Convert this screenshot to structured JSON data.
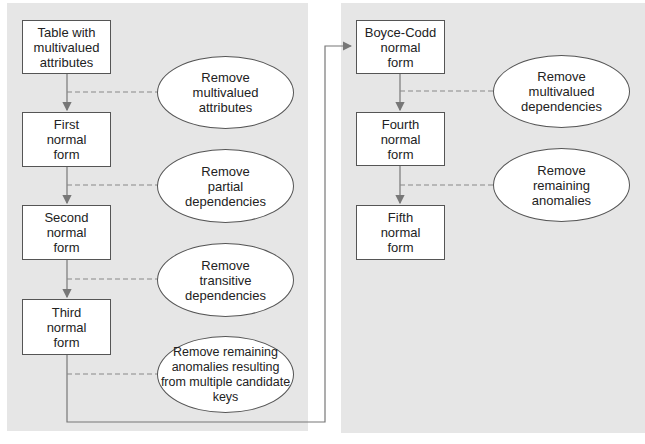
{
  "left_panel": {
    "boxes": [
      {
        "id": "table-mv",
        "label": "Table with\nmultivalued\nattributes"
      },
      {
        "id": "1nf",
        "label": "First\nnormal\nform"
      },
      {
        "id": "2nf",
        "label": "Second\nnormal\nform"
      },
      {
        "id": "3nf",
        "label": "Third\nnormal\nform"
      }
    ],
    "steps": [
      {
        "label": "Remove\nmultivalued\nattributes"
      },
      {
        "label": "Remove\npartial\ndependencies"
      },
      {
        "label": "Remove\ntransitive\ndependencies"
      },
      {
        "label": "Remove remaining\nanomalies resulting\nfrom multiple candidate\nkeys"
      }
    ]
  },
  "right_panel": {
    "boxes": [
      {
        "id": "bcnf",
        "label": "Boyce-Codd\nnormal\nform"
      },
      {
        "id": "4nf",
        "label": "Fourth\nnormal\nform"
      },
      {
        "id": "5nf",
        "label": "Fifth\nnormal\nform"
      }
    ],
    "steps": [
      {
        "label": "Remove\nmultivalued\ndependencies"
      },
      {
        "label": "Remove\nremaining\nanomalies"
      }
    ]
  },
  "colors": {
    "panel": "#e6e6e6",
    "line": "#777777",
    "border": "#555555"
  }
}
